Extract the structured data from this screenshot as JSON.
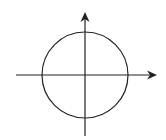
{
  "diagram": {
    "type": "unit-circle-on-axes",
    "stroke_color": "#222222",
    "background": "#ffffff",
    "circle": {
      "cx": 85,
      "cy": 75,
      "r": 43
    },
    "x_axis": {
      "x1": 16,
      "y": 75,
      "x2": 157,
      "arrow": "right"
    },
    "y_axis": {
      "x": 85,
      "y1": 136,
      "y2": 12,
      "arrow": "up"
    },
    "labels": []
  }
}
